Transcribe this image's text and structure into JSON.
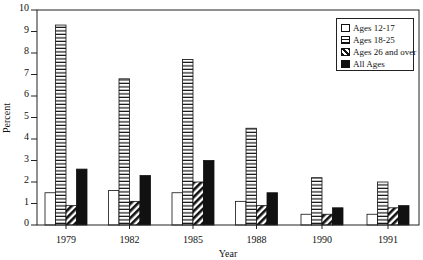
{
  "chart_data": {
    "type": "bar",
    "title": "",
    "xlabel": "Year",
    "ylabel": "Percent",
    "ylim": [
      0,
      10
    ],
    "yticks": [
      0,
      1,
      2,
      3,
      4,
      5,
      6,
      7,
      8,
      9,
      10
    ],
    "grid": false,
    "legend_position": "upper right",
    "categories": [
      "1979",
      "1982",
      "1985",
      "1988",
      "1990",
      "1991"
    ],
    "series": [
      {
        "name": "Ages 12-17",
        "pattern": "white",
        "values": [
          1.5,
          1.6,
          1.5,
          1.1,
          0.5,
          0.5
        ]
      },
      {
        "name": "Ages 18-25",
        "pattern": "horizontal-stripes",
        "values": [
          9.3,
          6.8,
          7.7,
          4.5,
          2.2,
          2.0
        ]
      },
      {
        "name": "Ages 26 and over",
        "pattern": "diagonal-hatch",
        "values": [
          0.9,
          1.1,
          2.0,
          0.9,
          0.5,
          0.8
        ]
      },
      {
        "name": "All Ages",
        "pattern": "solid-black",
        "values": [
          2.6,
          2.3,
          3.0,
          1.5,
          0.8,
          0.9
        ]
      }
    ]
  },
  "legend": {
    "items": [
      {
        "label": "Ages 12-17",
        "swatch": "white"
      },
      {
        "label": "Ages 18-25",
        "swatch": "striped"
      },
      {
        "label": "Ages 26 and over",
        "swatch": "hatched"
      },
      {
        "label": "All Ages",
        "swatch": "black"
      }
    ]
  },
  "colors": {
    "ink": "#111111",
    "background": "#ffffff"
  }
}
